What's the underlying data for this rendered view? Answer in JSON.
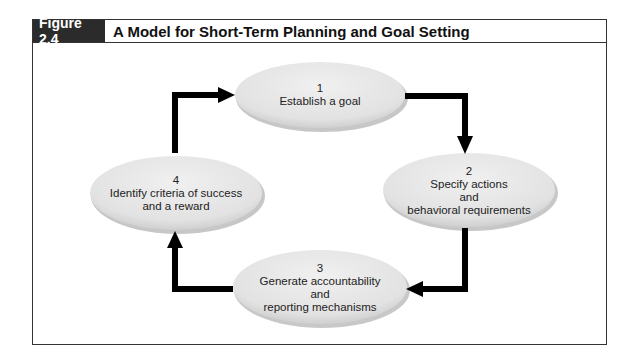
{
  "figure": {
    "label": "Figure 2.4",
    "title": "A Model for Short-Term Planning and Goal Setting"
  },
  "colors": {
    "label_bg": "#2b2b2b",
    "ellipse_fill": "#e4e4e4",
    "arrow": "#000000",
    "border": "#333333"
  },
  "nodes": [
    {
      "number": "1",
      "lines": [
        "Establish a goal"
      ]
    },
    {
      "number": "2",
      "lines": [
        "Specify actions",
        "and",
        "behavioral requirements"
      ]
    },
    {
      "number": "3",
      "lines": [
        "Generate accountability",
        "and",
        "reporting mechanisms"
      ]
    },
    {
      "number": "4",
      "lines": [
        "Identify criteria of success",
        "and a reward"
      ]
    }
  ],
  "edges": [
    {
      "from": "1",
      "to": "2"
    },
    {
      "from": "2",
      "to": "3"
    },
    {
      "from": "3",
      "to": "4"
    },
    {
      "from": "4",
      "to": "1"
    }
  ]
}
